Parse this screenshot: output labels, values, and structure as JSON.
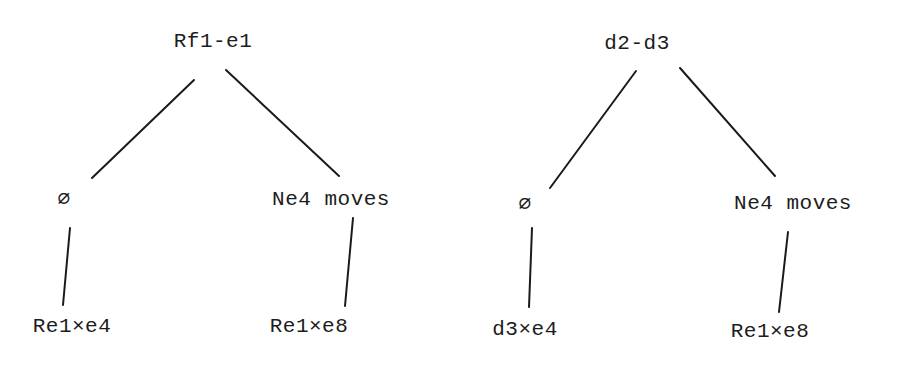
{
  "trees": [
    {
      "root": "Rf1-e1",
      "left_child": "∅",
      "right_child": "Ne4 moves",
      "left_leaf": "Re1×e4",
      "right_leaf": "Re1×e8"
    },
    {
      "root": "d2-d3",
      "left_child": "∅",
      "right_child": "Ne4 moves",
      "left_leaf": "d3×e4",
      "right_leaf": "Re1×e8"
    }
  ]
}
